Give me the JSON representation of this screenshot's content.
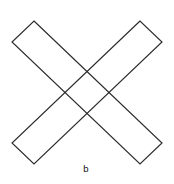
{
  "figure": {
    "title": "2 and 7",
    "caption": "b",
    "background_color": "#ffffff",
    "stroke_color": "#2b2b2b",
    "stroke_width": 1.15,
    "fill": "none",
    "width": 174,
    "height": 184
  },
  "chart_data": {
    "type": "diagram",
    "title": "2 and 7",
    "caption": "b",
    "xlabel": "",
    "ylabel": "",
    "xlim": [
      0,
      174
    ],
    "ylim": [
      0,
      184
    ],
    "grid": false,
    "legend": null,
    "shapes": [
      {
        "name": "bar-top-left-to-bottom-right",
        "kind": "rectangle-outline",
        "orientation": "descending",
        "points": [
          [
            34,
            21
          ],
          [
            162,
            143
          ],
          [
            140,
            164
          ],
          [
            12,
            42
          ]
        ],
        "stroke": "#2b2b2b",
        "fill": "none"
      },
      {
        "name": "bar-top-right-to-bottom-left",
        "kind": "rectangle-outline",
        "orientation": "ascending",
        "points": [
          [
            140,
            21
          ],
          [
            12,
            143
          ],
          [
            34,
            164
          ],
          [
            162,
            42
          ]
        ],
        "stroke": "#2b2b2b",
        "fill": "none"
      }
    ],
    "annotations": [
      {
        "name": "title-label",
        "text": "2 and 7",
        "x": 87,
        "y": 14,
        "anchor": "middle"
      },
      {
        "name": "caption-label",
        "text": "b",
        "x": 86,
        "y": 169,
        "anchor": "middle"
      }
    ]
  }
}
